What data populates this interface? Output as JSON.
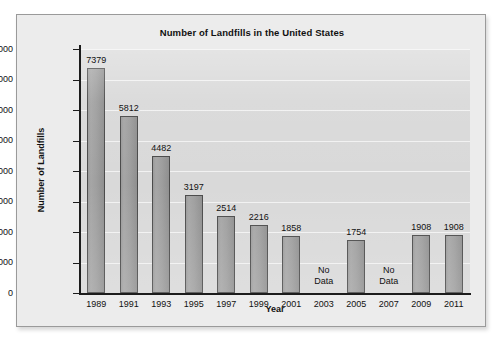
{
  "chart_data": {
    "type": "bar",
    "title": "Number of Landfills in the United States",
    "xlabel": "Year",
    "ylabel": "Number of Landfills",
    "categories": [
      "1989",
      "1991",
      "1993",
      "1995",
      "1997",
      "1999",
      "2001",
      "2003",
      "2005",
      "2007",
      "2009",
      "2011"
    ],
    "values": [
      7379,
      5812,
      4482,
      3197,
      2514,
      2216,
      1858,
      null,
      1754,
      null,
      1908,
      1908
    ],
    "point_labels": [
      "7379",
      "5812",
      "4482",
      "3197",
      "2514",
      "2216",
      "1858",
      "No Data",
      "1754",
      "No Data",
      "1908",
      "1908"
    ],
    "missing_label_lines": [
      "No",
      "Data"
    ],
    "ylim": [
      0,
      8000
    ],
    "ytick_values": [
      0,
      1000,
      2000,
      3000,
      4000,
      5000,
      6000,
      7000,
      8000
    ],
    "ytick_labels": [
      "0",
      "1,000",
      "2,000",
      "3,000",
      "4,000",
      "5,000",
      "6,000",
      "7,000",
      "8,000"
    ],
    "grid": "horizontal",
    "legend": "none",
    "colors": {
      "bar_fill": "#9e9e9e",
      "bar_edge": "#4a4a4a",
      "plot_background": "#d9d9d9",
      "figure_background": "#ececec",
      "gridline": "#f2f2f2",
      "axis": "#1c1c1c",
      "text": "#111111"
    }
  }
}
